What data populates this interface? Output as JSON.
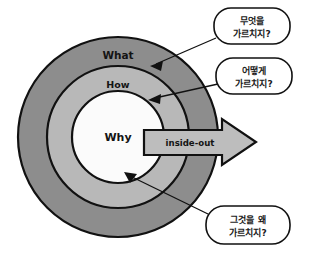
{
  "figure": {
    "type": "concentric-golden-circle-diagram",
    "background_color": "#ffffff"
  },
  "rings": [
    {
      "name": "outer-ring",
      "label": "What",
      "fill_color": "#8d8d8d",
      "stroke_color": "#111111",
      "outer_radius": 100,
      "inner_radius": 71
    },
    {
      "name": "middle-ring",
      "label": "How",
      "fill_color": "#b8b8b8",
      "stroke_color": "#111111",
      "outer_radius": 71,
      "inner_radius": 46
    },
    {
      "name": "inner-circle",
      "label": "Why",
      "fill_color": "#fbfbfb",
      "stroke_color": "#111111",
      "outer_radius": 46,
      "inner_radius": 0
    }
  ],
  "center": {
    "cx": 118,
    "cy": 137
  },
  "arrow": {
    "name": "inside-out-arrow",
    "label": "inside-out",
    "fill_color": "#bdbdbd",
    "stroke_color": "#111111",
    "direction": "right",
    "start_x": 144,
    "tip_x": 256
  },
  "callouts": [
    {
      "id": "callout-what",
      "line1": "무엇을",
      "line2": "가르치지?",
      "target_ring": "What",
      "box": {
        "x": 214,
        "y": 8,
        "w": 76,
        "h": 36
      },
      "pointer_to": {
        "x": 150,
        "y": 66
      }
    },
    {
      "id": "callout-how",
      "line1": "어떻게",
      "line2": "가르치지?",
      "target_ring": "How",
      "box": {
        "x": 216,
        "y": 58,
        "w": 76,
        "h": 36
      },
      "pointer_to": {
        "x": 148,
        "y": 100
      }
    },
    {
      "id": "callout-why",
      "line1": "그것을 왜",
      "line2": "가르치지?",
      "target_ring": "Why",
      "box": {
        "x": 206,
        "y": 206,
        "w": 84,
        "h": 38
      },
      "pointer_to": {
        "x": 124,
        "y": 172
      }
    }
  ],
  "colors": {
    "outer_gray": "#8d8d8d",
    "middle_gray": "#b8b8b8",
    "inner_white": "#fbfbfb",
    "arrow_gray": "#bdbdbd",
    "outline": "#111111",
    "bubble_fill": "#ffffff"
  }
}
